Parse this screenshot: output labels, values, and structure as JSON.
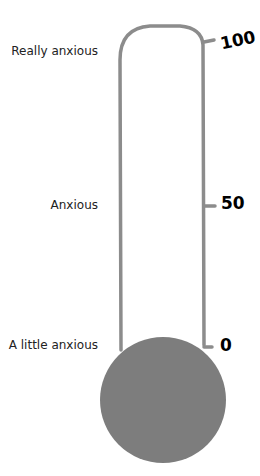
{
  "diagram": {
    "type": "thermometer",
    "colors": {
      "outline": "#8c8c8c",
      "bulb": "#7d7d7d",
      "text": "#222222"
    },
    "labels": [
      {
        "text": "Really anxious",
        "level": 100
      },
      {
        "text": "Anxious",
        "level": 50
      },
      {
        "text": "A little anxious",
        "level": 0
      }
    ],
    "ticks": [
      {
        "text": "100",
        "value": 100
      },
      {
        "text": "50",
        "value": 50
      },
      {
        "text": "0",
        "value": 0
      }
    ]
  }
}
